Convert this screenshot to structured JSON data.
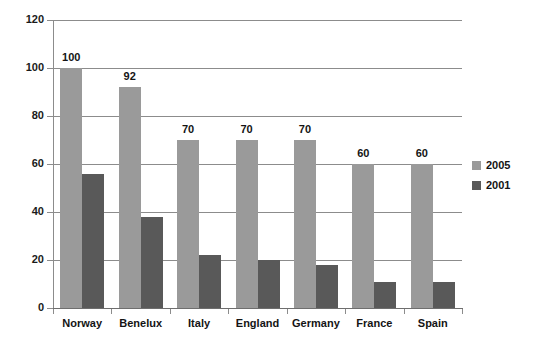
{
  "chart_data": {
    "type": "bar",
    "title": "",
    "subtitle": "",
    "xlabel": "",
    "ylabel": "",
    "categories": [
      "Norway",
      "Benelux",
      "Italy",
      "England",
      "Germany",
      "France",
      "Spain"
    ],
    "series": [
      {
        "name": "2005",
        "color": "#9a9a9a",
        "values": [
          100,
          92,
          70,
          70,
          70,
          60,
          60
        ],
        "labels": [
          "100",
          "92",
          "70",
          "70",
          "70",
          "60",
          "60"
        ],
        "show_data_labels": true
      },
      {
        "name": "2001",
        "color": "#595959",
        "values": [
          56,
          38,
          22,
          20,
          18,
          11,
          11
        ],
        "labels": [
          "",
          "",
          "",
          "",
          "",
          "",
          ""
        ],
        "show_data_labels": false
      }
    ],
    "ylim": [
      0,
      120
    ],
    "yticks": [
      0,
      20,
      40,
      60,
      80,
      100,
      120
    ],
    "ytick_labels": [
      "0",
      "20",
      "40",
      "60",
      "80",
      "100",
      "120"
    ],
    "grid": true,
    "grid_axis": "y",
    "legend_position": "right",
    "axis_color": "#8c8c8c",
    "background": "#ffffff"
  },
  "legend": {
    "entries": [
      {
        "label": "2005",
        "color": "#9a9a9a"
      },
      {
        "label": "2001",
        "color": "#595959"
      }
    ]
  }
}
